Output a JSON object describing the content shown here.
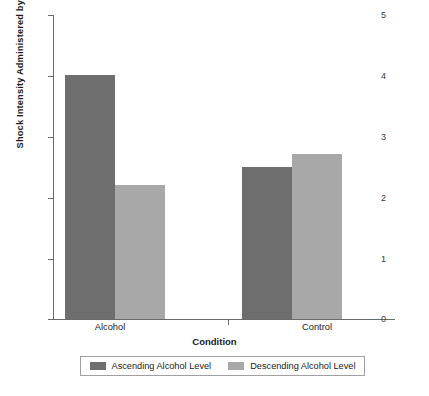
{
  "chart_data": {
    "type": "bar",
    "title": "",
    "xlabel": "Condition",
    "ylabel": "Shock Intensity Administered by Participant",
    "categories": [
      "Alcohol",
      "Control"
    ],
    "series": [
      {
        "name": "Ascending Alcohol Level",
        "values": [
          4.0,
          2.5
        ],
        "color": "#6e6e6e"
      },
      {
        "name": "Descending Alcohol Level",
        "values": [
          2.2,
          2.7
        ],
        "color": "#a8a8a8"
      }
    ],
    "ylim": [
      0,
      5
    ],
    "yticks": [
      "0",
      "1",
      "2",
      "3",
      "4",
      "5"
    ],
    "grid": false,
    "legend_position": "bottom"
  },
  "axis": {
    "y_label": "Shock Intensity Administered by Participant",
    "x_label": "Condition",
    "y_tick_labels": [
      "5",
      "4",
      "3",
      "2",
      "1",
      "0"
    ],
    "x_tick_labels": [
      "Alcohol",
      "Control"
    ]
  },
  "legend": {
    "items": [
      {
        "label": "Ascending Alcohol Level",
        "color": "#6e6e6e"
      },
      {
        "label": "Descending Alcohol Level",
        "color": "#a8a8a8"
      }
    ]
  },
  "caption": {
    "text": ""
  }
}
